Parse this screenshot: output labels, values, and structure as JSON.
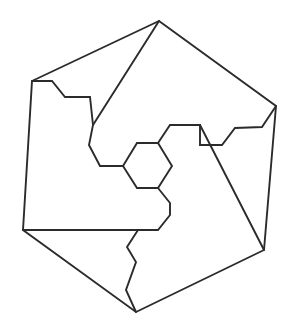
{
  "figure": {
    "type": "line-drawing",
    "canvas": {
      "width": 297,
      "height": 327
    },
    "background_color": "#ffffff",
    "stroke_color": "#2b2b2b",
    "stroke_width": 1.9,
    "shapes": [
      {
        "name": "outer-hexagon",
        "closed": true,
        "points": [
          [
            159,
            21
          ],
          [
            276,
            106
          ],
          [
            264,
            250
          ],
          [
            136,
            312
          ],
          [
            23,
            230
          ],
          [
            32,
            81
          ]
        ]
      },
      {
        "name": "top-vertex-diagonal",
        "closed": false,
        "points": [
          [
            159,
            21
          ],
          [
            93,
            125
          ]
        ]
      },
      {
        "name": "upper-left-staircase",
        "closed": false,
        "points": [
          [
            32,
            81
          ],
          [
            52,
            81
          ],
          [
            65,
            97
          ],
          [
            90,
            97
          ],
          [
            93,
            125
          ],
          [
            89,
            145
          ],
          [
            100,
            166
          ],
          [
            123,
            166
          ]
        ]
      },
      {
        "name": "central-hexagon",
        "closed": true,
        "points": [
          [
            137,
            143
          ],
          [
            158,
            143
          ],
          [
            172,
            166
          ],
          [
            158,
            188
          ],
          [
            137,
            188
          ],
          [
            123,
            166
          ]
        ]
      },
      {
        "name": "right-upper-staircase",
        "closed": false,
        "points": [
          [
            158,
            143
          ],
          [
            170,
            125
          ],
          [
            200,
            125
          ],
          [
            200,
            145
          ],
          [
            222,
            145
          ],
          [
            235,
            128
          ],
          [
            262,
            127
          ],
          [
            276,
            106
          ]
        ]
      },
      {
        "name": "right-vertex-diagonal",
        "closed": false,
        "points": [
          [
            200,
            125
          ],
          [
            264,
            250
          ]
        ]
      },
      {
        "name": "lower-staircase",
        "closed": false,
        "points": [
          [
            158,
            188
          ],
          [
            170,
            203
          ],
          [
            170,
            215
          ],
          [
            158,
            230
          ],
          [
            23,
            230
          ]
        ]
      },
      {
        "name": "bottom-zigzag",
        "closed": false,
        "points": [
          [
            138,
            230
          ],
          [
            127,
            247
          ],
          [
            136,
            262
          ],
          [
            126,
            290
          ],
          [
            136,
            312
          ]
        ]
      }
    ]
  }
}
